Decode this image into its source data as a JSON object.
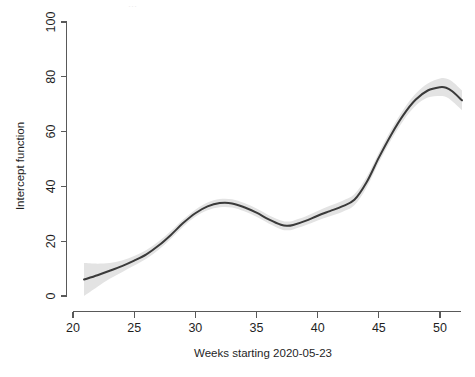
{
  "chart_data": {
    "type": "line",
    "title": "",
    "xlabel": "Weeks starting 2020-05-23",
    "ylabel": "Intercept function",
    "xlim": [
      20.9,
      51.8
    ],
    "ylim": [
      0,
      100
    ],
    "grid": false,
    "legend": null,
    "x_ticks": [
      20,
      25,
      30,
      35,
      40,
      45,
      50
    ],
    "x_tick_labels": [
      "20",
      "25",
      "30",
      "35",
      "40",
      "45",
      "50"
    ],
    "y_ticks": [
      0,
      20,
      40,
      60,
      80,
      100
    ],
    "y_tick_labels": [
      "0",
      "20",
      "40",
      "60",
      "80",
      "100"
    ],
    "series": [
      {
        "name": "Intercept function",
        "style": "smooth-line",
        "color": "#3a3a3a",
        "x": [
          20.9,
          22,
          23,
          24,
          25,
          26,
          27,
          28,
          29,
          30,
          31,
          32,
          33,
          34,
          35,
          36,
          37,
          37.5,
          38,
          39,
          40,
          41,
          42,
          43,
          44,
          45,
          46,
          47,
          48,
          49,
          50,
          50.5,
          51,
          51.8
        ],
        "values": [
          6.0,
          7.6,
          9.2,
          10.9,
          12.9,
          15.2,
          18.4,
          22.3,
          26.6,
          30.2,
          32.7,
          33.9,
          33.8,
          32.4,
          30.4,
          28.0,
          26.0,
          25.6,
          25.9,
          27.4,
          29.3,
          31.0,
          32.7,
          35.1,
          41.5,
          50.5,
          58.8,
          66.0,
          71.6,
          75.0,
          76.2,
          76.0,
          74.7,
          71.4
        ]
      },
      {
        "name": "Confidence band upper",
        "style": "ci-upper",
        "color": "#e3e3e3",
        "x": [
          20.9,
          22,
          23,
          24,
          25,
          26,
          27,
          28,
          29,
          30,
          31,
          32,
          33,
          34,
          35,
          36,
          37,
          37.5,
          38,
          39,
          40,
          41,
          42,
          43,
          44,
          45,
          46,
          47,
          48,
          49,
          50,
          50.5,
          51,
          51.8
        ],
        "values": [
          12.0,
          11.8,
          12.0,
          13.0,
          14.6,
          16.8,
          19.9,
          23.7,
          27.9,
          31.5,
          34.1,
          35.4,
          35.3,
          33.9,
          31.9,
          29.5,
          27.6,
          27.2,
          27.5,
          29.0,
          31.0,
          32.9,
          34.7,
          37.1,
          43.4,
          52.3,
          60.7,
          68.0,
          73.8,
          77.6,
          79.4,
          79.4,
          78.3,
          75.0
        ]
      },
      {
        "name": "Confidence band lower",
        "style": "ci-lower",
        "color": "#e3e3e3",
        "x": [
          20.9,
          22,
          23,
          24,
          25,
          26,
          27,
          28,
          29,
          30,
          31,
          32,
          33,
          34,
          35,
          36,
          37,
          37.5,
          38,
          39,
          40,
          41,
          42,
          43,
          44,
          45,
          46,
          47,
          48,
          49,
          50,
          50.5,
          51,
          51.8
        ],
        "values": [
          0.0,
          3.4,
          6.3,
          8.7,
          11.1,
          13.6,
          16.9,
          20.9,
          25.3,
          28.9,
          31.3,
          32.4,
          32.3,
          30.9,
          28.9,
          26.5,
          24.4,
          24.0,
          24.3,
          25.8,
          27.6,
          29.1,
          30.7,
          33.1,
          39.6,
          48.7,
          56.9,
          64.0,
          69.4,
          72.4,
          73.0,
          72.6,
          71.1,
          67.8
        ]
      }
    ]
  },
  "axes": {
    "y_axis_label": "Intercept function",
    "x_axis_label": "Weeks starting 2020-05-23"
  }
}
